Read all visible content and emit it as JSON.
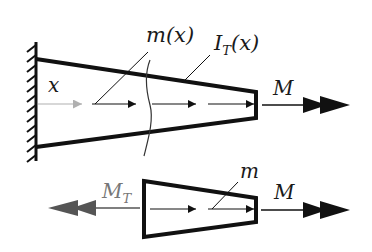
{
  "diagram": {
    "colors": {
      "stroke": "#111111",
      "grey_arrow": "#b0b0b0",
      "reaction_arrow": "#555555",
      "label": "#1a1a1a",
      "label_grey": "#777777"
    },
    "top": {
      "support": "fixed-wall",
      "labels": {
        "distributed_torque": "m(x)",
        "distributed_torque_main": "m",
        "distributed_torque_arg": "(x)",
        "section_inertia_main": "I",
        "section_inertia_sub": "T",
        "section_inertia_arg": "(x)",
        "axis": "x",
        "applied_moment": "M"
      }
    },
    "bottom": {
      "labels": {
        "reaction_main": "M",
        "reaction_sub": "T",
        "distributed_torque": "m",
        "applied_moment": "M"
      }
    }
  }
}
